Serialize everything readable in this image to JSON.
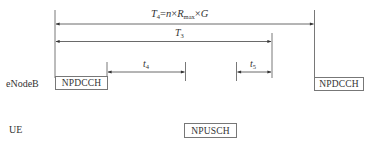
{
  "diagram": {
    "entities": {
      "enodeb_label": "eNodeB",
      "ue_label": "UE"
    },
    "channels": {
      "npdcch_left": "NPDCCH",
      "npdcch_right": "NPDCCH",
      "npusch": "NPUSCH"
    },
    "intervals": {
      "t4_big": {
        "symbol": "T",
        "subscript": "4",
        "formula_eq": "=",
        "n": "n",
        "times": "×",
        "R": "R",
        "R_sub": "max",
        "G": "G"
      },
      "t3": {
        "symbol": "T",
        "subscript": "3"
      },
      "t4_small": {
        "symbol": "t",
        "subscript": "4"
      },
      "t5_small": {
        "symbol": "t",
        "subscript": "5"
      }
    },
    "colors": {
      "line": "#555555",
      "text": "#333333",
      "box_border": "#777777",
      "background": "#ffffff"
    }
  }
}
